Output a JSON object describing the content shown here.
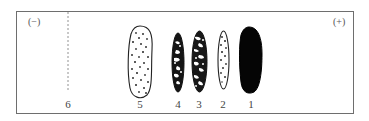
{
  "diagram": {
    "type": "gel-electrophoresis",
    "poles": {
      "negative": "(−)",
      "positive": "(+)"
    },
    "origin_label": "6",
    "bands": [
      {
        "label": "1",
        "pattern": "solid-black"
      },
      {
        "label": "2",
        "pattern": "sparse-dots"
      },
      {
        "label": "3",
        "pattern": "dense-mottled"
      },
      {
        "label": "4",
        "pattern": "dense-mottled"
      },
      {
        "label": "5",
        "pattern": "dotted-large"
      }
    ],
    "colors": {
      "border": "#6e6e6e",
      "ink": "#111111",
      "background": "#ffffff"
    }
  }
}
